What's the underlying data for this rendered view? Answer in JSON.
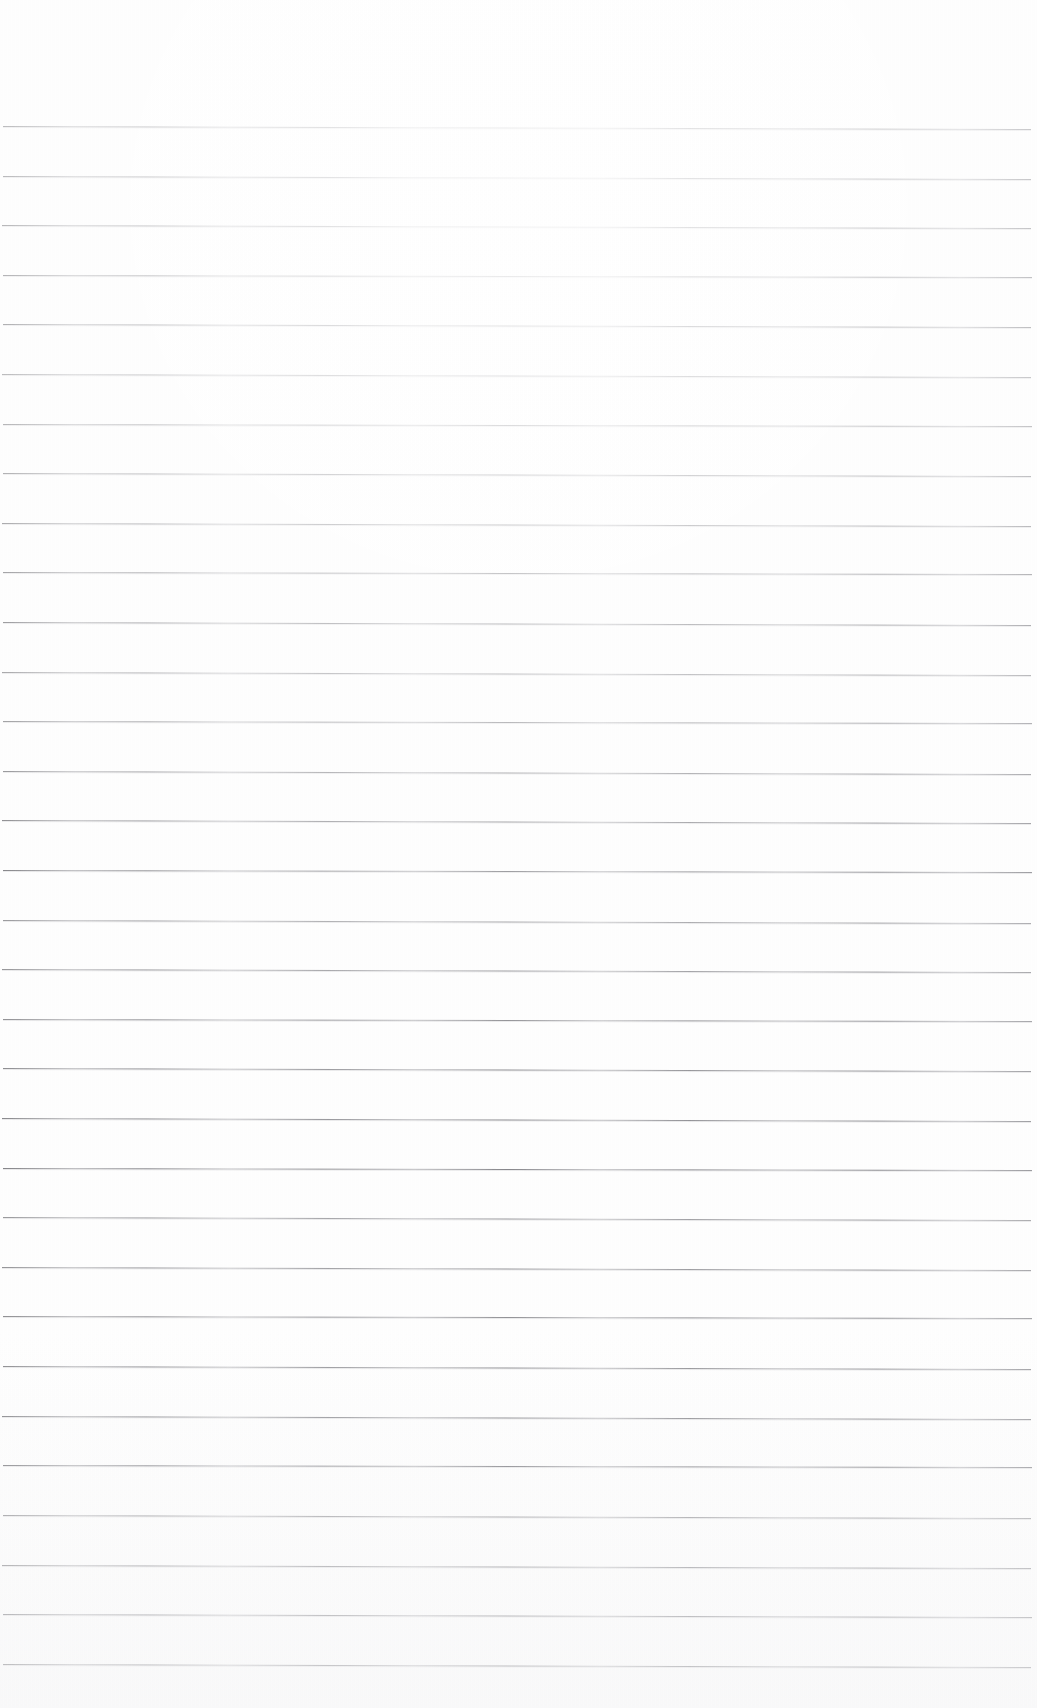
{
  "document": {
    "kind": "scanned-ruled-notebook-page",
    "title": "Blank Ruled Paper Scan",
    "page_width": 1037,
    "page_height": 1708,
    "background_color": "#fefefe",
    "has_text_content": false,
    "visible_text": "",
    "notes": "Empty lined writing paper; no handwriting, headings, margins rule, page numbers or other marks are visible."
  },
  "ruling": {
    "line_color": "#8b8b90",
    "line_thickness_px": 1,
    "line_count": 32,
    "first_line_y": 126,
    "line_spacing_px": 49.6,
    "left_x": 3,
    "right_x": 1031,
    "tilt_px_over_width": 3,
    "top_margin_px": 126,
    "bottom_margin_px": 44,
    "left_margin_px": 3,
    "right_margin_px": 6,
    "lines": [
      {
        "index": 1,
        "y": 126,
        "left_x": 3,
        "right_x": 1031,
        "tilt": 3
      },
      {
        "index": 2,
        "y": 176,
        "left_x": 3,
        "right_x": 1031,
        "tilt": 3
      },
      {
        "index": 3,
        "y": 225,
        "left_x": 2,
        "right_x": 1031,
        "tilt": 3
      },
      {
        "index": 4,
        "y": 275,
        "left_x": 3,
        "right_x": 1032,
        "tilt": 2
      },
      {
        "index": 5,
        "y": 324,
        "left_x": 3,
        "right_x": 1031,
        "tilt": 3
      },
      {
        "index": 6,
        "y": 374,
        "left_x": 2,
        "right_x": 1031,
        "tilt": 3
      },
      {
        "index": 7,
        "y": 424,
        "left_x": 3,
        "right_x": 1032,
        "tilt": 2
      },
      {
        "index": 8,
        "y": 473,
        "left_x": 3,
        "right_x": 1031,
        "tilt": 3
      },
      {
        "index": 9,
        "y": 523,
        "left_x": 2,
        "right_x": 1031,
        "tilt": 3
      },
      {
        "index": 10,
        "y": 572,
        "left_x": 3,
        "right_x": 1032,
        "tilt": 2
      },
      {
        "index": 11,
        "y": 622,
        "left_x": 3,
        "right_x": 1031,
        "tilt": 3
      },
      {
        "index": 12,
        "y": 672,
        "left_x": 2,
        "right_x": 1031,
        "tilt": 3
      },
      {
        "index": 13,
        "y": 721,
        "left_x": 3,
        "right_x": 1032,
        "tilt": 2
      },
      {
        "index": 14,
        "y": 771,
        "left_x": 3,
        "right_x": 1031,
        "tilt": 3
      },
      {
        "index": 15,
        "y": 820,
        "left_x": 2,
        "right_x": 1031,
        "tilt": 3
      },
      {
        "index": 16,
        "y": 870,
        "left_x": 3,
        "right_x": 1032,
        "tilt": 2
      },
      {
        "index": 17,
        "y": 920,
        "left_x": 3,
        "right_x": 1031,
        "tilt": 3
      },
      {
        "index": 18,
        "y": 969,
        "left_x": 2,
        "right_x": 1031,
        "tilt": 3
      },
      {
        "index": 19,
        "y": 1019,
        "left_x": 3,
        "right_x": 1032,
        "tilt": 2
      },
      {
        "index": 20,
        "y": 1068,
        "left_x": 3,
        "right_x": 1031,
        "tilt": 3
      },
      {
        "index": 21,
        "y": 1118,
        "left_x": 2,
        "right_x": 1031,
        "tilt": 3
      },
      {
        "index": 22,
        "y": 1168,
        "left_x": 3,
        "right_x": 1032,
        "tilt": 2
      },
      {
        "index": 23,
        "y": 1217,
        "left_x": 3,
        "right_x": 1031,
        "tilt": 3
      },
      {
        "index": 24,
        "y": 1267,
        "left_x": 2,
        "right_x": 1031,
        "tilt": 3
      },
      {
        "index": 25,
        "y": 1316,
        "left_x": 3,
        "right_x": 1032,
        "tilt": 2
      },
      {
        "index": 26,
        "y": 1366,
        "left_x": 3,
        "right_x": 1031,
        "tilt": 3
      },
      {
        "index": 27,
        "y": 1416,
        "left_x": 2,
        "right_x": 1031,
        "tilt": 3
      },
      {
        "index": 28,
        "y": 1465,
        "left_x": 3,
        "right_x": 1032,
        "tilt": 2
      },
      {
        "index": 29,
        "y": 1515,
        "left_x": 3,
        "right_x": 1031,
        "tilt": 3
      },
      {
        "index": 30,
        "y": 1565,
        "left_x": 2,
        "right_x": 1031,
        "tilt": 3
      },
      {
        "index": 31,
        "y": 1614,
        "left_x": 3,
        "right_x": 1032,
        "tilt": 3
      },
      {
        "index": 32,
        "y": 1664,
        "left_x": 3,
        "right_x": 1031,
        "tilt": 3
      }
    ]
  }
}
